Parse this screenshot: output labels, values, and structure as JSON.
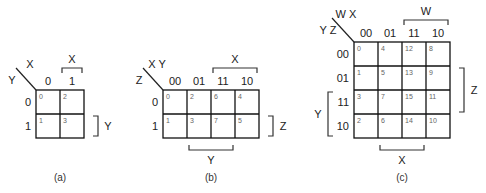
{
  "maps": [
    {
      "id": "a",
      "caption": "(a)",
      "row_var": "Y",
      "col_var": "X",
      "col_headers": [
        "0",
        "1"
      ],
      "row_headers": [
        "0",
        "1"
      ],
      "cells": [
        [
          "0",
          "2"
        ],
        [
          "1",
          "3"
        ]
      ],
      "top_bracket": {
        "label": "X",
        "from": 1,
        "to": 1
      },
      "right_bracket": {
        "label": "Y",
        "from": 1,
        "to": 1
      }
    },
    {
      "id": "b",
      "caption": "(b)",
      "row_var": "Z",
      "col_var": "X Y",
      "col_headers": [
        "00",
        "01",
        "11",
        "10"
      ],
      "row_headers": [
        "0",
        "1"
      ],
      "cells": [
        [
          "0",
          "2",
          "6",
          "4"
        ],
        [
          "1",
          "3",
          "7",
          "5"
        ]
      ],
      "top_bracket": {
        "label": "X",
        "from": 2,
        "to": 3
      },
      "right_bracket": {
        "label": "Z",
        "from": 1,
        "to": 1
      },
      "bottom_bracket": {
        "label": "Y",
        "from": 1,
        "to": 2
      }
    },
    {
      "id": "c",
      "caption": "(c)",
      "row_var": "Y Z",
      "col_var": "W X",
      "col_headers": [
        "00",
        "01",
        "11",
        "10"
      ],
      "row_headers": [
        "00",
        "01",
        "11",
        "10"
      ],
      "cells": [
        [
          "0",
          "4",
          "12",
          "8"
        ],
        [
          "1",
          "5",
          "13",
          "9"
        ],
        [
          "3",
          "7",
          "15",
          "11"
        ],
        [
          "2",
          "6",
          "14",
          "10"
        ]
      ],
      "top_bracket": {
        "label": "W",
        "from": 2,
        "to": 3
      },
      "right_bracket": {
        "label": "Z",
        "from": 1,
        "to": 2
      },
      "left_bracket": {
        "label": "Y",
        "from": 2,
        "to": 3
      },
      "bottom_bracket": {
        "label": "X",
        "from": 1,
        "to": 2
      }
    }
  ]
}
